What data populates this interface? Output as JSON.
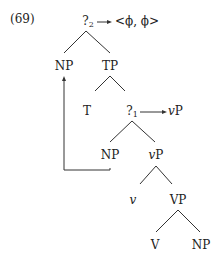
{
  "example_number": "(69)",
  "tree": {
    "root": {
      "label": "?",
      "subscript": "2",
      "maps_to": "<ϕ, ϕ>"
    },
    "np_spec": {
      "label": "NP"
    },
    "tp": {
      "label": "TP"
    },
    "t": {
      "label": "T"
    },
    "q1": {
      "label": "?",
      "subscript": "1",
      "maps_to_italic": "v",
      "maps_to_rest": "P"
    },
    "np_inner": {
      "label": "NP"
    },
    "vp_small": {
      "italic": "v",
      "rest": "P"
    },
    "v_small": {
      "label": "v"
    },
    "vp": {
      "label": "VP"
    },
    "v": {
      "label": "V"
    },
    "np_obj": {
      "label": "NP"
    }
  },
  "movement": {
    "from": "np_inner",
    "to": "np_spec"
  }
}
